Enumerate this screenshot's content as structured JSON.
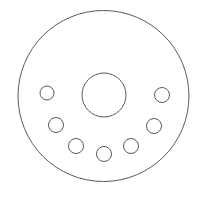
{
  "drawing": {
    "title": "Brake Disc Hub Face Outline",
    "view": "front-elevation",
    "background_color": "#ffffff",
    "line_color": "#5a5a5a",
    "line_width": 1,
    "fill": "none",
    "canvas": {
      "width": 207,
      "height": 200
    },
    "outer_disc": {
      "name": "disc-outer-edge",
      "shape": "circle",
      "cx": 103.5,
      "cy": 96,
      "r": 85.5
    },
    "center_bore": {
      "name": "center-bore",
      "shape": "circle",
      "cx": 104,
      "cy": 95,
      "r": 22
    },
    "bolt_holes": [
      {
        "name": "bolt-hole-left",
        "cx": 47,
        "cy": 93,
        "r": 7
      },
      {
        "name": "bolt-hole-lower-left",
        "cx": 56,
        "cy": 125,
        "r": 7.5
      },
      {
        "name": "bolt-hole-bottom-left",
        "cx": 76,
        "cy": 146,
        "r": 7.5
      },
      {
        "name": "bolt-hole-bottom",
        "cx": 104,
        "cy": 154,
        "r": 7.5
      },
      {
        "name": "bolt-hole-bottom-right",
        "cx": 131,
        "cy": 146,
        "r": 7.5
      },
      {
        "name": "bolt-hole-lower-right",
        "cx": 154,
        "cy": 126,
        "r": 7.5
      },
      {
        "name": "bolt-hole-right",
        "cx": 162,
        "cy": 95,
        "r": 7.5
      }
    ]
  }
}
